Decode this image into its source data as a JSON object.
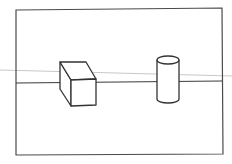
{
  "diagram": {
    "title": "",
    "colors": {
      "background": "#ffffff",
      "stroke": "#3a3a3a",
      "guide": "#c8c8c8"
    },
    "elements": [
      {
        "id": "frame",
        "type": "rectangle"
      },
      {
        "id": "horizon",
        "type": "line"
      },
      {
        "id": "guide-line",
        "type": "line"
      },
      {
        "id": "cube",
        "type": "cube"
      },
      {
        "id": "cylinder",
        "type": "cylinder"
      }
    ]
  }
}
